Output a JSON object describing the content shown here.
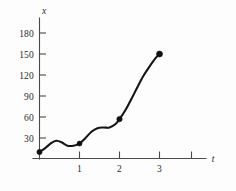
{
  "figure": {
    "background_color": "#fdfdfd",
    "curve_color": "#151515",
    "axis_color": "#4a4a4a",
    "marker_color": "#111111"
  },
  "chart_data": {
    "type": "line",
    "title": "",
    "subtitle": "",
    "xlabel": "t",
    "ylabel": "x",
    "grid": false,
    "legend": false,
    "xlim": [
      0,
      4.1
    ],
    "ylim": [
      0,
      195
    ],
    "x_ticks": [
      1,
      2,
      3,
      4
    ],
    "x_tick_labels": [
      "1",
      "2",
      "3",
      ""
    ],
    "y_ticks": [
      30,
      60,
      90,
      120,
      150,
      180
    ],
    "y_tick_labels": [
      "30",
      "60",
      "90",
      "120",
      "150",
      "180"
    ],
    "series": [
      {
        "name": "x(t)",
        "marker_points": {
          "x": [
            0,
            1,
            2,
            3
          ],
          "y": [
            10,
            22,
            57,
            150
          ]
        },
        "curve": {
          "x": [
            0.0,
            0.15,
            0.3,
            0.42,
            0.55,
            0.7,
            0.85,
            1.0,
            1.15,
            1.3,
            1.45,
            1.6,
            1.75,
            1.9,
            2.0,
            2.15,
            2.3,
            2.45,
            2.6,
            2.75,
            2.9,
            3.0
          ],
          "y": [
            10,
            16,
            23,
            26,
            24,
            19,
            19,
            22,
            30,
            39,
            44,
            45,
            45,
            50,
            57,
            70,
            86,
            103,
            119,
            132,
            144,
            150
          ]
        }
      }
    ],
    "annotations": []
  },
  "axis_labels": {
    "y_axis_name": "x",
    "x_axis_name": "t"
  }
}
